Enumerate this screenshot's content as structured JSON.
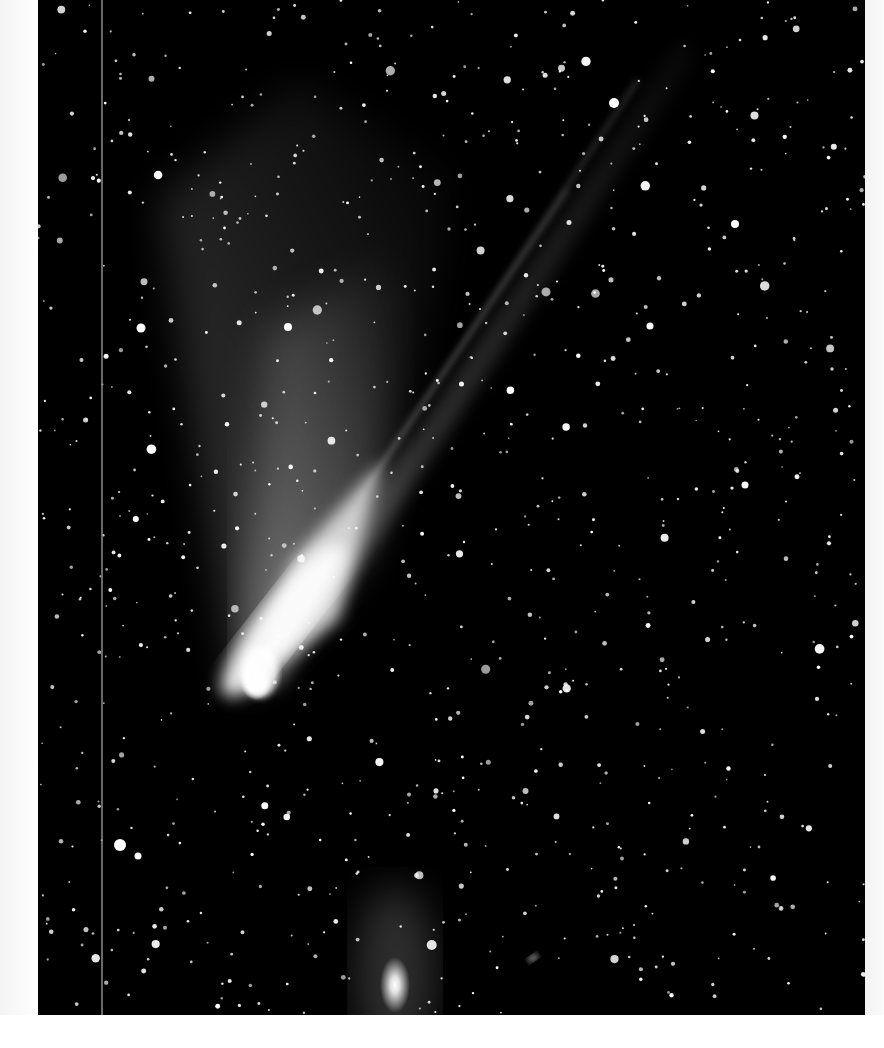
{
  "photo": {
    "subject": "comet-with-tail-and-galaxy",
    "background_color": "#000000",
    "star_color": "#ffffff",
    "tail_color": "#f2f2f2",
    "star_count": 900
  },
  "comet": {
    "head": {
      "x": 215,
      "y": 683
    },
    "dust_tail_direction": "upper-left",
    "ion_tail_end": {
      "x": 620,
      "y": 60
    }
  },
  "galaxy": {
    "x": 357,
    "y": 985
  },
  "small_galaxy": {
    "x": 495,
    "y": 958
  }
}
